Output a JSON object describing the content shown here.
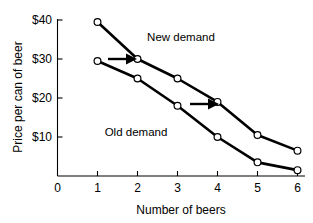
{
  "chart_data": {
    "type": "line",
    "title": "",
    "xlabel": "Number of beers",
    "ylabel": "Price per can of beer",
    "xlim": [
      0,
      6.3
    ],
    "ylim": [
      0,
      41
    ],
    "grid": false,
    "legend_position": "inline-annotations",
    "x_tick_labels": [
      "0",
      "1",
      "2",
      "3",
      "4",
      "5",
      "6"
    ],
    "x_ticks": [
      0,
      1,
      2,
      3,
      4,
      5,
      6
    ],
    "y_tick_labels": [
      "$40",
      "$30",
      "$20",
      "$10"
    ],
    "y_ticks": [
      40,
      30,
      20,
      10
    ],
    "series": [
      {
        "name": "New demand",
        "x": [
          1,
          2,
          3,
          4,
          5,
          6
        ],
        "values": [
          39.5,
          30,
          25,
          19,
          10.5,
          6.5
        ],
        "marker": "open-circle",
        "color": "#000000"
      },
      {
        "name": "Old demand",
        "x": [
          1,
          2,
          3,
          4,
          5,
          6
        ],
        "values": [
          29.5,
          25,
          18,
          10,
          3.5,
          1.5
        ],
        "marker": "open-circle",
        "color": "#000000"
      }
    ],
    "annotations": [
      {
        "text": "New demand",
        "x": 3.05,
        "y": 34.5
      },
      {
        "text": "Old demand",
        "x": 1.9,
        "y": 12.5
      },
      {
        "text": "",
        "type": "arrow",
        "x_start": 1.25,
        "y_start": 30,
        "x_end": 1.85,
        "y_end": 30
      },
      {
        "text": "",
        "type": "arrow",
        "x_start": 3.3,
        "y_start": 18.6,
        "x_end": 3.9,
        "y_end": 18.6
      }
    ]
  },
  "axes": {
    "y_label": "Price per can of beer",
    "x_label": "Number of beers",
    "y_tick_0": "$40",
    "y_tick_1": "$30",
    "y_tick_2": "$20",
    "y_tick_3": "$10",
    "x_tick_0": "0",
    "x_tick_1": "1",
    "x_tick_2": "2",
    "x_tick_3": "3",
    "x_tick_4": "4",
    "x_tick_5": "5",
    "x_tick_6": "6"
  },
  "labels": {
    "new_demand": "New demand",
    "old_demand": "Old demand"
  },
  "colors": {
    "line": "#000000",
    "marker_fill": "#ffffff",
    "background": "#ffffff"
  }
}
